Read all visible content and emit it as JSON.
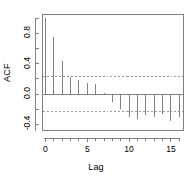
{
  "chart_data": {
    "type": "bar",
    "title": "",
    "xlabel": "Lag",
    "ylabel": "ACF",
    "x": [
      0,
      1,
      2,
      3,
      4,
      5,
      6,
      7,
      8,
      9,
      10,
      11,
      12,
      13,
      14,
      15,
      16
    ],
    "values": [
      1.0,
      0.75,
      0.44,
      0.23,
      0.19,
      0.14,
      0.13,
      0.02,
      -0.11,
      -0.2,
      -0.3,
      -0.33,
      -0.28,
      -0.3,
      -0.26,
      -0.35,
      -0.3
    ],
    "categories": [
      "0",
      "1",
      "2",
      "3",
      "4",
      "5",
      "6",
      "7",
      "8",
      "9",
      "10",
      "11",
      "12",
      "13",
      "14",
      "15",
      "16"
    ],
    "xlim": [
      -0.35,
      16.5
    ],
    "ylim": [
      -0.48,
      1.05
    ],
    "xticks": [
      0,
      5,
      10,
      15
    ],
    "xtick_labels": [
      "0",
      "5",
      "10",
      "15"
    ],
    "yticks": [
      -0.4,
      0.0,
      0.4,
      0.8
    ],
    "ytick_labels": [
      "-0.4",
      "0.0",
      "0.4",
      "0.8"
    ],
    "yminor_ticks": [
      -0.2,
      0.2,
      0.6,
      1.0
    ],
    "grid": false,
    "legend": "none",
    "zero_line": 0.0,
    "confidence_bands": [
      0.23,
      -0.23
    ],
    "confidence_style": "dashed",
    "series_color": "#808080",
    "axis_color": "#808080",
    "confidence_color": "#9a9a9a",
    "background": "#ffffff"
  }
}
